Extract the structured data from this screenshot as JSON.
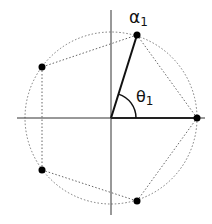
{
  "diagram": {
    "center": [
      111,
      118
    ],
    "radius": 86,
    "points": [
      {
        "name": "alpha1",
        "x": 137,
        "y": 35
      },
      {
        "name": "p2",
        "x": 42,
        "y": 67
      },
      {
        "name": "p3",
        "x": 42,
        "y": 170
      },
      {
        "name": "p4",
        "x": 137,
        "y": 201
      },
      {
        "name": "p5",
        "x": 197,
        "y": 118
      }
    ],
    "labels": {
      "alpha": "α",
      "alpha_sub": "1",
      "theta": "θ",
      "theta_sub": "1"
    },
    "colors": {
      "axis": "#333333",
      "dotted": "#666666",
      "point": "#000000"
    }
  }
}
